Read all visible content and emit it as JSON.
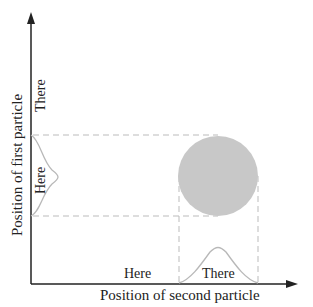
{
  "diagram": {
    "y_axis_label": "Position of first particle",
    "x_axis_label": "Position of second particle",
    "y_ticks": {
      "here": "Here",
      "there": "There"
    },
    "x_ticks": {
      "here": "Here",
      "there": "There"
    },
    "colors": {
      "axis": "#222222",
      "dashed": "#bbbbbb",
      "circle": "#c8c8c8",
      "curve": "#b8b8b8"
    }
  }
}
